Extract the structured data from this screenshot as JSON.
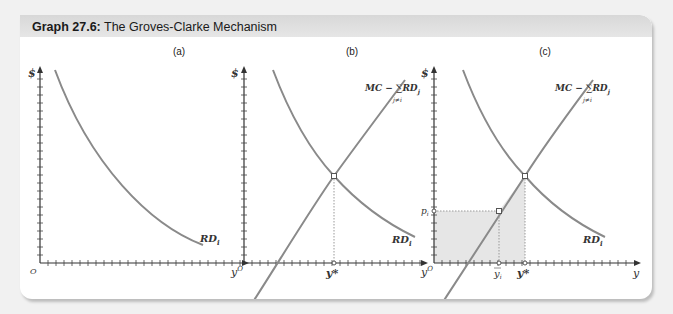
{
  "header": {
    "title_prefix": "Graph 27.6:",
    "title_text": " The Groves-Clarke Mechanism"
  },
  "panels": [
    {
      "id": "a",
      "label": "(a)",
      "y_axis": "$",
      "origin": "O",
      "curves": [
        "RD_i"
      ]
    },
    {
      "id": "b",
      "label": "(b)",
      "y_axis": "$",
      "origin": "y^O",
      "x_marks": [
        "y*"
      ],
      "curves": [
        "MC − Σ_{j≠i} RD_j",
        "RD_i"
      ]
    },
    {
      "id": "c",
      "label": "(c)",
      "y_axis": "$",
      "origin": "y^O",
      "x_axis": "y",
      "x_marks": [
        "ȳ_i",
        "y*"
      ],
      "y_marks": [
        "p_i"
      ],
      "curves": [
        "MC − Σ_{j≠i} RD_j",
        "RD_i"
      ],
      "shaded_region": "area under MC − ΣRD_j curve between ȳ_i and y*, plus rectangle below p_i"
    }
  ],
  "labels": {
    "a": "(a)",
    "b": "(b)",
    "c": "(c)",
    "dollar": "$",
    "origin_a": "O",
    "yO": "y",
    "yO_sup": "O",
    "rd": "RD",
    "rd_sub": "i",
    "mc": "MC − ",
    "sigma": "∑",
    "rdj": "RD",
    "rdj_sub": "j",
    "sum_sub": "j≠i",
    "ystar": "y*",
    "ybar": "y",
    "ybar_sub": "i",
    "p": "p",
    "p_sub": "i",
    "y_axis": "y"
  },
  "colors": {
    "curve": "#8a8a8a",
    "axis": "#333333",
    "shade": "#e3e3e3",
    "header": "#dcdcdc"
  }
}
